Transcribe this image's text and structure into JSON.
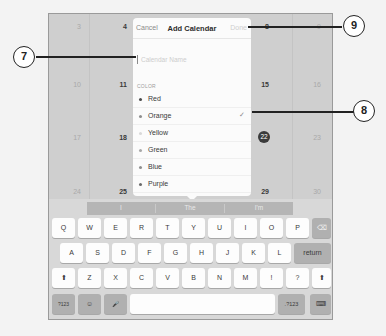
{
  "calendar": {
    "rows": [
      {
        "left": [
          "3",
          "4"
        ],
        "right": [
          "8",
          "9"
        ]
      },
      {
        "left": [
          "10",
          "11"
        ],
        "right": [
          "15",
          "16"
        ]
      },
      {
        "left": [
          "17",
          "18"
        ],
        "right": [
          "22",
          "23"
        ]
      },
      {
        "left": [
          "24",
          "25"
        ],
        "right": [
          "29",
          "30"
        ]
      }
    ],
    "today": "22"
  },
  "popover": {
    "cancel_label": "Cancel",
    "title": "Add Calendar",
    "done_label": "Done",
    "name_placeholder": "Calendar Name",
    "name_value": "",
    "color_section_label": "COLOR",
    "colors": [
      {
        "name": "Red",
        "dot": "#4a4a4a",
        "selected": false
      },
      {
        "name": "Orange",
        "dot": "#8e8e8e",
        "selected": true
      },
      {
        "name": "Yellow",
        "dot": "#d9d9d9",
        "selected": false
      },
      {
        "name": "Green",
        "dot": "#a8a8a8",
        "selected": false
      },
      {
        "name": "Blue",
        "dot": "#8e8e8e",
        "selected": false
      },
      {
        "name": "Purple",
        "dot": "#6a6a6a",
        "selected": false
      },
      {
        "name": "Brown",
        "dot": "#9a9a9a",
        "selected": false
      }
    ],
    "check_glyph": "✓"
  },
  "keyboard": {
    "suggestions": [
      "I",
      "The",
      "I'm"
    ],
    "row1": [
      "Q",
      "W",
      "E",
      "R",
      "T",
      "Y",
      "U",
      "I",
      "O",
      "P"
    ],
    "row2": [
      "A",
      "S",
      "D",
      "F",
      "G",
      "H",
      "J",
      "K",
      "L"
    ],
    "row3": [
      "Z",
      "X",
      "C",
      "V",
      "B",
      "N",
      "M",
      "!",
      "?"
    ],
    "delete_icon": "⌫",
    "return_label": "return",
    "shift_glyph": "⬆",
    "numbers_label": ".?123",
    "numbers_label_left": "?123",
    "emoji_glyph": "☺",
    "mic_glyph": "🎤",
    "hide_keyboard_glyph": "⌨",
    "space_label": ""
  },
  "callouts": [
    {
      "number": "7",
      "target": "calendar-name-field"
    },
    {
      "number": "8",
      "target": "selected-color-checkmark"
    },
    {
      "number": "9",
      "target": "done-button"
    }
  ]
}
